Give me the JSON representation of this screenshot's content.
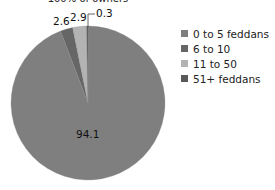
{
  "title": "100% of owners",
  "chart_data": {
    "type": "pie",
    "title": "100% of owners",
    "categories": [
      "0 to 5 feddans",
      "6 to 10",
      "11 to 50",
      "51+ feddans"
    ],
    "values": [
      94.1,
      2.6,
      2.9,
      0.3
    ],
    "colors": [
      "#7f7f7f",
      "#666666",
      "#b3b3b3",
      "#595959"
    ],
    "data_labels": [
      "94.1",
      "2.6",
      "2.9",
      "0.3"
    ],
    "start_angle": "12 o'clock, clockwise",
    "legend_position": "right"
  },
  "legend": {
    "items": [
      {
        "label": "0 to 5 feddans",
        "color": "#7f7f7f"
      },
      {
        "label": "6 to 10",
        "color": "#666666"
      },
      {
        "label": "11 to 50",
        "color": "#b3b3b3"
      },
      {
        "label": "51+ feddans",
        "color": "#595959"
      }
    ]
  },
  "labels": {
    "s0": "94.1",
    "s1": "2.6",
    "s2": "2.9",
    "s3": "0.3"
  }
}
